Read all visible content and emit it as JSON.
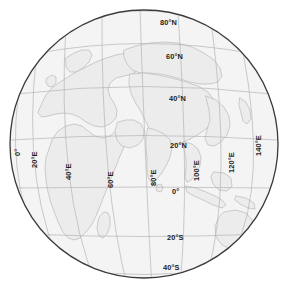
{
  "figure": {
    "type": "orthographic-globe-map",
    "title": "",
    "projection": "orthographic",
    "center_lon": 70,
    "center_lat": 22,
    "graticule_interval_deg": 20,
    "colors": {
      "background": "#ffffff",
      "ocean": "#f4f4f4",
      "land": "#ececec",
      "coastline": "#b9b9b9",
      "graticule": "#b0b0b0",
      "limb": "#3a3a3a",
      "label": "#1c1c1c"
    }
  },
  "labels": {
    "latitude": [
      {
        "text": "80°N",
        "value": 80,
        "x": 160,
        "y": 25
      },
      {
        "text": "60°N",
        "value": 60,
        "x": 166,
        "y": 59
      },
      {
        "text": "40°N",
        "value": 40,
        "x": 169,
        "y": 101
      },
      {
        "text": "20°N",
        "value": 20,
        "x": 170,
        "y": 148
      },
      {
        "text": "0°",
        "value": 0,
        "x": 172,
        "y": 194
      },
      {
        "text": "20°S",
        "value": -20,
        "x": 167,
        "y": 240
      },
      {
        "text": "40°S",
        "value": -40,
        "x": 163,
        "y": 270
      }
    ],
    "longitude": [
      {
        "text": "0°",
        "value": 0,
        "x": 20,
        "y": 156,
        "rotate": -90
      },
      {
        "text": "20°E",
        "value": 20,
        "x": 37,
        "y": 168,
        "rotate": -90
      },
      {
        "text": "40°E",
        "value": 40,
        "x": 71,
        "y": 180,
        "rotate": -90
      },
      {
        "text": "60°E",
        "value": 60,
        "x": 113,
        "y": 188,
        "rotate": -90
      },
      {
        "text": "80°E",
        "value": 80,
        "x": 156,
        "y": 186,
        "rotate": -90
      },
      {
        "text": "100°E",
        "value": 100,
        "x": 199,
        "y": 181,
        "rotate": -90
      },
      {
        "text": "120°E",
        "value": 120,
        "x": 234,
        "y": 173,
        "rotate": -90
      },
      {
        "text": "140°E",
        "value": 140,
        "x": 261,
        "y": 156,
        "rotate": -90
      }
    ]
  },
  "landmasses": [
    "europe",
    "africa",
    "asia",
    "arabia",
    "india",
    "southeast-asia",
    "australia",
    "madagascar",
    "sri-lanka",
    "japan",
    "indonesia",
    "scandinavia",
    "british-isles"
  ]
}
